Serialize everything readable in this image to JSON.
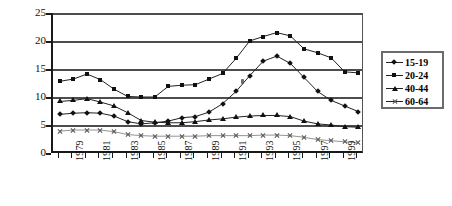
{
  "chart_data": {
    "type": "line",
    "title": "",
    "xlabel": "",
    "ylabel": "",
    "ylim": [
      0,
      25
    ],
    "yticks": [
      0,
      5,
      10,
      15,
      20,
      25
    ],
    "grid": "horizontal",
    "legend_position": "right",
    "x": [
      1978,
      1979,
      1980,
      1981,
      1982,
      1983,
      1984,
      1985,
      1986,
      1987,
      1988,
      1989,
      1990,
      1991,
      1992,
      1993,
      1994,
      1995,
      1996,
      1997,
      1998,
      1999,
      2000
    ],
    "xtick_labels": [
      "1979",
      "1981",
      "1983",
      "1985",
      "1987",
      "1989",
      "1991",
      "1993",
      "1995",
      "1997",
      "1999"
    ],
    "series": [
      {
        "name": "15-19",
        "marker": "diamond",
        "values": [
          6.9,
          7.1,
          7.2,
          7.1,
          6.6,
          5.6,
          5.2,
          5.4,
          5.7,
          6.3,
          6.5,
          7.3,
          8.8,
          11.0,
          13.8,
          16.4,
          17.3,
          16.0,
          13.5,
          11.0,
          9.4,
          8.4,
          7.4
        ]
      },
      {
        "name": "20-24",
        "marker": "square",
        "values": [
          12.8,
          13.2,
          14.1,
          13.1,
          11.4,
          10.1,
          10.0,
          10.0,
          11.9,
          12.1,
          12.2,
          13.2,
          14.2,
          16.9,
          20.0,
          20.8,
          21.5,
          20.9,
          18.6,
          17.9,
          17.0,
          14.5,
          14.3
        ]
      },
      {
        "name": "40-44",
        "marker": "triangle",
        "values": [
          9.2,
          9.4,
          9.7,
          9.1,
          8.4,
          7.2,
          5.8,
          5.5,
          5.4,
          5.4,
          5.6,
          5.9,
          6.1,
          6.4,
          6.6,
          6.7,
          6.7,
          6.5,
          5.7,
          5.2,
          5.0,
          4.7,
          4.6
        ]
      },
      {
        "name": "60-64",
        "marker": "cross",
        "values": [
          3.9,
          4.1,
          4.1,
          4.1,
          3.8,
          3.3,
          3.1,
          3.0,
          3.0,
          3.0,
          3.0,
          3.1,
          3.1,
          3.1,
          3.1,
          3.2,
          3.2,
          3.1,
          2.8,
          2.4,
          2.2,
          2.0,
          1.8
        ]
      }
    ]
  },
  "legend": {
    "items": [
      {
        "label": "15-19"
      },
      {
        "label": "20-24"
      },
      {
        "label": "40-44"
      },
      {
        "label": "60-64"
      }
    ]
  },
  "axis": {
    "y_labels": [
      "25",
      "20",
      "15",
      "10",
      "5",
      "0"
    ]
  }
}
